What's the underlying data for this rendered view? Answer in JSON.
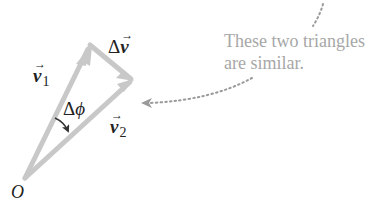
{
  "diagram": {
    "labels": {
      "v1": {
        "symbol": "v",
        "subscript": "1",
        "arrow": "→"
      },
      "dv": {
        "prefix": "Δ",
        "symbol": "v",
        "arrow": "→"
      },
      "dphi": {
        "prefix": "Δ",
        "symbol": "ϕ"
      },
      "v2": {
        "symbol": "v",
        "subscript": "2",
        "arrow": "→"
      },
      "origin": "O"
    },
    "annotation": {
      "line1": "These two triangles",
      "line2": "are similar."
    },
    "colors": {
      "vector": "#c8c8c8",
      "label": "#222222",
      "annotation": "#a7a7a7",
      "dotted": "#9a9a9a"
    }
  }
}
